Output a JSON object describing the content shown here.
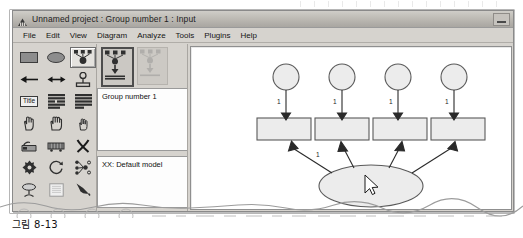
{
  "window": {
    "title": "Unnamed project : Group number 1 : Input",
    "app_icon": "amos-icon",
    "controls": {
      "minimize": "minimize-button"
    }
  },
  "menubar": {
    "items": [
      {
        "label": "File"
      },
      {
        "label": "Edit"
      },
      {
        "label": "View"
      },
      {
        "label": "Diagram"
      },
      {
        "label": "Analyze"
      },
      {
        "label": "Tools"
      },
      {
        "label": "Plugins"
      },
      {
        "label": "Help"
      }
    ]
  },
  "toolbar": {
    "tools": [
      {
        "name": "draw-observed-variable-icon",
        "label": "",
        "selected": false
      },
      {
        "name": "draw-unobserved-variable-icon",
        "label": "",
        "selected": false
      },
      {
        "name": "draw-latent-with-indicators-icon",
        "label": "",
        "selected": true
      },
      {
        "name": "draw-path-arrow-icon",
        "label": "",
        "selected": false
      },
      {
        "name": "draw-covariance-arrow-icon",
        "label": "",
        "selected": false
      },
      {
        "name": "add-unique-variable-icon",
        "label": "",
        "selected": false
      },
      {
        "name": "figure-caption-icon",
        "label": "Title",
        "selected": false
      },
      {
        "name": "list-variables-in-dataset-icon",
        "label": "",
        "selected": false
      },
      {
        "name": "list-variables-in-model-icon",
        "label": "",
        "selected": false
      },
      {
        "name": "select-one-object-icon",
        "label": "",
        "selected": false
      },
      {
        "name": "select-all-objects-icon",
        "label": "",
        "selected": false
      },
      {
        "name": "deselect-all-objects-icon",
        "label": "",
        "selected": false
      },
      {
        "name": "duplicate-object-icon",
        "label": "",
        "selected": false
      },
      {
        "name": "move-object-icon",
        "label": "",
        "selected": false
      },
      {
        "name": "erase-object-icon",
        "label": "",
        "selected": false
      },
      {
        "name": "change-shape-icon",
        "label": "",
        "selected": false
      },
      {
        "name": "rotate-indicators-icon",
        "label": "",
        "selected": false
      },
      {
        "name": "reflect-indicators-icon",
        "label": "",
        "selected": false
      },
      {
        "name": "move-parameter-values-icon",
        "label": "",
        "selected": false
      },
      {
        "name": "scroll-diagram-icon",
        "label": "",
        "selected": false
      },
      {
        "name": "touch-up-variable-icon",
        "label": "",
        "selected": false
      }
    ]
  },
  "browser": {
    "thumbnails": [
      {
        "name": "model-thumbnail-input",
        "selected": true
      },
      {
        "name": "model-thumbnail-output",
        "selected": false
      }
    ],
    "group_label": "Group number 1",
    "model_label": "XX: Default model"
  },
  "diagram": {
    "latent": {
      "label": "",
      "name": "latent-variable-ellipse"
    },
    "indicators": [
      {
        "label": "",
        "error_label": "",
        "path_label": "1"
      },
      {
        "label": "",
        "error_label": "",
        "path_label": "1"
      },
      {
        "label": "",
        "error_label": "",
        "path_label": "1"
      },
      {
        "label": "",
        "error_label": "",
        "path_label": "1"
      }
    ],
    "error_path_label": "1",
    "loading_label": "1",
    "cursor": "mouse-pointer"
  },
  "figure": {
    "caption": "그림 8-13"
  },
  "colors": {
    "chrome": "#d6d3ce",
    "titlebar": "#bab7b1",
    "canvas": "#ffffff",
    "shape_fill": "#ececec",
    "shape_stroke": "#555555"
  }
}
